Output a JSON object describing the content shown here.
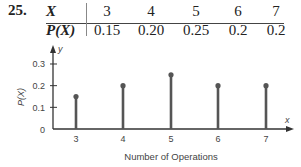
{
  "problem_number": "25.",
  "table": {
    "row_headers": [
      "X",
      "P(X)"
    ],
    "x_values": [
      "3",
      "4",
      "5",
      "6",
      "7"
    ],
    "p_values": [
      "0.15",
      "0.20",
      "0.25",
      "0.2",
      "0.2"
    ]
  },
  "chart_data": {
    "type": "bar",
    "style": "stem",
    "categories": [
      "3",
      "4",
      "5",
      "6",
      "7"
    ],
    "values": [
      0.15,
      0.2,
      0.25,
      0.2,
      0.2
    ],
    "title": "",
    "xlabel": "Number of Operations",
    "ylabel": "P(X)",
    "x_axis_letter": "x",
    "y_axis_letter": "y",
    "yticks": [
      "0",
      "0.1",
      "0.2",
      "0.3"
    ],
    "ylim": [
      0,
      0.35
    ],
    "grid": false,
    "color": "#555555"
  }
}
